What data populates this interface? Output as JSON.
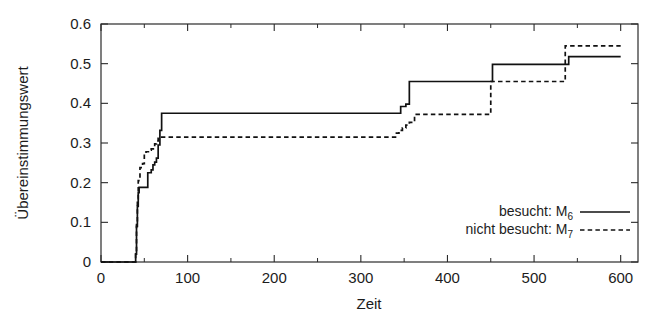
{
  "chart_data": {
    "type": "line",
    "title": "",
    "subtitle": "",
    "xlabel": "Zeit",
    "ylabel": "Übereinstimmungswert",
    "xlim": [
      0,
      620
    ],
    "ylim": [
      0,
      0.6
    ],
    "grid": false,
    "legend_position": "bottom-right",
    "x_ticks": [
      0,
      100,
      200,
      300,
      400,
      500,
      600
    ],
    "x_tick_labels": [
      "0",
      "100",
      "200",
      "300",
      "400",
      "500",
      "600"
    ],
    "x_minor_ticks": [
      50,
      150,
      250,
      350,
      450,
      550
    ],
    "y_ticks": [
      0,
      0.1,
      0.2,
      0.3,
      0.4,
      0.5,
      0.6
    ],
    "y_tick_labels": [
      "0",
      "0.1",
      "0.2",
      "0.3",
      "0.4",
      "0.5",
      "0.6"
    ],
    "step_interpolation": "post",
    "series": [
      {
        "name": "besucht: M6",
        "legend_label": "besucht: M",
        "legend_subscript": "6",
        "style": "solid",
        "color": "#111111",
        "x": [
          0,
          38,
          40,
          41,
          42,
          43,
          44,
          52,
          54,
          58,
          60,
          62,
          64,
          66,
          68,
          70,
          340,
          346,
          352,
          356,
          450,
          452,
          535,
          540,
          600
        ],
        "y": [
          0.0,
          0.0,
          0.02,
          0.09,
          0.14,
          0.175,
          0.188,
          0.188,
          0.225,
          0.232,
          0.245,
          0.252,
          0.262,
          0.295,
          0.332,
          0.375,
          0.375,
          0.392,
          0.398,
          0.455,
          0.455,
          0.498,
          0.498,
          0.518,
          0.518
        ]
      },
      {
        "name": "nicht besucht: M7",
        "legend_label": "nicht besucht: M",
        "legend_subscript": "7",
        "style": "dashed",
        "color": "#111111",
        "x": [
          0,
          38,
          40,
          41,
          42,
          43,
          45,
          48,
          50,
          52,
          56,
          58,
          62,
          64,
          66,
          68,
          335,
          340,
          344,
          348,
          352,
          356,
          362,
          448,
          450,
          530,
          536,
          600
        ],
        "y": [
          0.0,
          0.0,
          0.02,
          0.1,
          0.16,
          0.205,
          0.238,
          0.248,
          0.272,
          0.278,
          0.282,
          0.285,
          0.298,
          0.305,
          0.312,
          0.315,
          0.315,
          0.325,
          0.332,
          0.338,
          0.345,
          0.352,
          0.372,
          0.372,
          0.455,
          0.455,
          0.545,
          0.545
        ]
      }
    ]
  },
  "axes": {
    "x_axis_label": "Zeit",
    "y_axis_label": "Übereinstimmungswert"
  },
  "legend": {
    "entries": [
      {
        "label": "besucht: M",
        "subscript": "6",
        "style": "solid"
      },
      {
        "label": "nicht besucht: M",
        "subscript": "7",
        "style": "dashed"
      }
    ]
  },
  "colors": {
    "line": "#111111",
    "frame": "#2a2a2a",
    "background": "#ffffff",
    "text": "#1c1c1c"
  }
}
